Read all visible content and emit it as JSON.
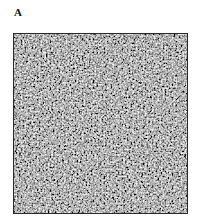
{
  "figure": {
    "panel_label": "A",
    "image": {
      "description": "grayscale noisy micrograph texture",
      "colors": {
        "base": "#3a3a3a",
        "border": "#2a2a2a"
      }
    }
  }
}
